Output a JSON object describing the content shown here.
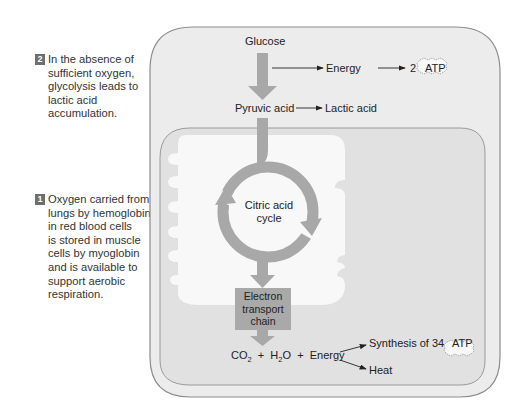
{
  "notes": [
    {
      "number": "2",
      "lines": [
        "In the absence of",
        "sufficient oxygen,",
        "glycolysis leads to",
        "lactic acid",
        "accumulation."
      ]
    },
    {
      "number": "1",
      "lines": [
        "Oxygen carried from",
        "lungs by hemoglobin",
        "in red blood cells",
        "is stored in muscle",
        "cells by myoglobin",
        "and is available to",
        "support aerobic",
        "respiration."
      ]
    }
  ],
  "diagram": {
    "glucose": "Glucose",
    "energy_top": "Energy",
    "atp_count_top": "2",
    "atp_label": "ATP",
    "pyruvic_acid": "Pyruvic acid",
    "lactic_acid": "Lactic acid",
    "citric_acid_cycle_line1": "Citric acid",
    "citric_acid_cycle_line2": "cycle",
    "etc_line1": "Electron",
    "etc_line2": "transport",
    "etc_line3": "chain",
    "co2_main": "CO",
    "co2_sub": "2",
    "plus1": "+",
    "h2o_h": "H",
    "h2o_sub": "2",
    "h2o_o": "O",
    "plus2": "+",
    "energy_bottom": "Energy",
    "synthesis": "Synthesis of 34",
    "atp_label_bottom": "ATP",
    "heat": "Heat"
  },
  "colors": {
    "cell_fill": "#ececec",
    "mito_fill": "#e1e1e1",
    "matrix_fill": "#f7f7f7",
    "arrow_gray": "#a8a8a8",
    "border": "#8c8c8c"
  }
}
